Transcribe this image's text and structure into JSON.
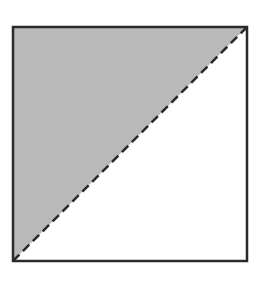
{
  "diagram": {
    "type": "square-with-diagonal",
    "square": {
      "x": 13,
      "y": 27,
      "size": 234
    },
    "shaded_region": "upper-left-triangle",
    "diagonal": {
      "from": "bottom-left",
      "to": "top-right",
      "style": "dashed"
    },
    "colors": {
      "fill": "#b9b9b9",
      "border": "#2a2a2a",
      "dash": "#2a2a2a",
      "background": "#ffffff"
    }
  }
}
